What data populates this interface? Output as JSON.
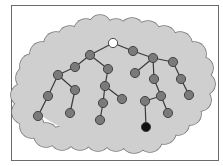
{
  "diagram": {
    "title": "",
    "colors": {
      "cloud_fill": "#cfcfcf",
      "cloud_stroke": "#777777",
      "node_fill": "#7a7a7a",
      "node_stroke": "#3a3a3a",
      "edge": "#3a3a3a",
      "root_fill": "#ffffff",
      "target_fill": "#111111"
    },
    "nodes": [
      {
        "id": "root",
        "type": "root"
      },
      {
        "id": "n1",
        "type": "normal"
      },
      {
        "id": "n2",
        "type": "normal"
      },
      {
        "id": "n3",
        "type": "normal"
      },
      {
        "id": "n4",
        "type": "normal"
      },
      {
        "id": "n5",
        "type": "normal"
      },
      {
        "id": "n6",
        "type": "normal"
      },
      {
        "id": "n7",
        "type": "normal"
      },
      {
        "id": "n8",
        "type": "normal"
      },
      {
        "id": "n9",
        "type": "normal"
      },
      {
        "id": "n10",
        "type": "normal"
      },
      {
        "id": "n11",
        "type": "normal"
      },
      {
        "id": "n12",
        "type": "normal"
      },
      {
        "id": "n13",
        "type": "normal"
      },
      {
        "id": "n14",
        "type": "normal"
      },
      {
        "id": "n15",
        "type": "normal"
      },
      {
        "id": "n16",
        "type": "normal"
      },
      {
        "id": "n17",
        "type": "normal"
      },
      {
        "id": "n18",
        "type": "normal"
      },
      {
        "id": "n19",
        "type": "normal"
      },
      {
        "id": "n20",
        "type": "normal"
      },
      {
        "id": "n21",
        "type": "normal"
      },
      {
        "id": "n22",
        "type": "target"
      },
      {
        "id": "n23",
        "type": "normal"
      }
    ],
    "edges": [
      [
        "root",
        "n1"
      ],
      [
        "n1",
        "n2"
      ],
      [
        "n2",
        "n3"
      ],
      [
        "n3",
        "n4"
      ],
      [
        "n4",
        "n5"
      ],
      [
        "n3",
        "n6"
      ],
      [
        "n6",
        "n7"
      ],
      [
        "n1",
        "n8"
      ],
      [
        "n8",
        "n9"
      ],
      [
        "n9",
        "n10"
      ],
      [
        "n10",
        "n11"
      ],
      [
        "n9",
        "n12"
      ],
      [
        "root",
        "n13"
      ],
      [
        "n13",
        "n14"
      ],
      [
        "n14",
        "n15"
      ],
      [
        "n14",
        "n16"
      ],
      [
        "n14",
        "n17"
      ],
      [
        "n17",
        "n18"
      ],
      [
        "n18",
        "n19"
      ],
      [
        "n16",
        "n20"
      ],
      [
        "n20",
        "n21"
      ],
      [
        "n21",
        "n22"
      ],
      [
        "n20",
        "n23"
      ]
    ]
  }
}
